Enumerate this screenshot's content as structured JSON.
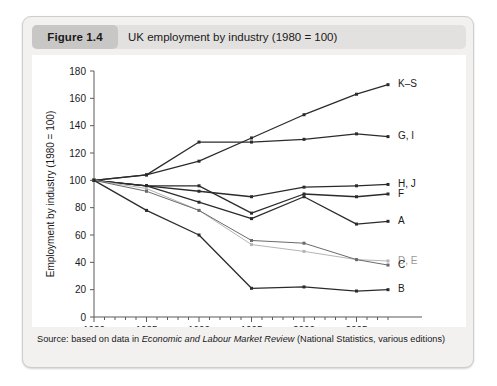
{
  "figure": {
    "number_label": "Figure 1.4",
    "title": "UK employment by industry (1980 = 100)",
    "source": "Source: based on data in ",
    "source_italic": "Economic and Labour Market Review",
    "source_tail": " (National Statistics, various editions)"
  },
  "chart_data": {
    "type": "line",
    "title": "UK employment by industry (1980 = 100)",
    "xlabel": "",
    "ylabel": "Employment by industry (1980 = 100)",
    "x": [
      1980,
      1985,
      1990,
      1995,
      2000,
      2005,
      2008
    ],
    "xlim": [
      1980,
      2008
    ],
    "ylim": [
      0,
      180
    ],
    "ytick_values": [
      0,
      20,
      40,
      60,
      80,
      100,
      120,
      140,
      160,
      180
    ],
    "xtick_values": [
      1980,
      1985,
      1990,
      1995,
      2000,
      2005
    ],
    "xtick_labels": [
      "1980",
      "1985",
      "1990",
      "1995",
      "2000",
      "2005"
    ],
    "ytick_labels": [
      "0",
      "20",
      "40",
      "60",
      "80",
      "100",
      "120",
      "140",
      "160",
      "180"
    ],
    "minor_xticks": true,
    "grid": false,
    "legend": "right-end-labels",
    "series": [
      {
        "name": "K–S",
        "label": "K–S",
        "color": "#2b2b2b",
        "values": [
          100,
          104,
          114,
          131,
          148,
          163,
          170
        ]
      },
      {
        "name": "G, I",
        "label": "G, I",
        "color": "#2b2b2b",
        "values": [
          100,
          104,
          128,
          128,
          130,
          134,
          132
        ]
      },
      {
        "name": "H, J",
        "label": "H, J",
        "color": "#2b2b2b",
        "values": [
          100,
          96,
          92,
          88,
          95,
          96,
          97
        ]
      },
      {
        "name": "F",
        "label": "F",
        "color": "#2b2b2b",
        "values": [
          100,
          96,
          96,
          76,
          90,
          88,
          90
        ]
      },
      {
        "name": "A",
        "label": "A",
        "color": "#2b2b2b",
        "values": [
          100,
          96,
          84,
          72,
          88,
          68,
          70
        ]
      },
      {
        "name": "D, E",
        "label": "D, E",
        "color": "#b5b5b5",
        "values": [
          100,
          94,
          78,
          53,
          48,
          42,
          41
        ]
      },
      {
        "name": "C",
        "label": "C",
        "color": "#6a6a6a",
        "values": [
          100,
          92,
          78,
          56,
          54,
          42,
          38
        ]
      },
      {
        "name": "B",
        "label": "B",
        "color": "#2b2b2b",
        "values": [
          100,
          78,
          60,
          21,
          22,
          19,
          20
        ]
      }
    ]
  }
}
